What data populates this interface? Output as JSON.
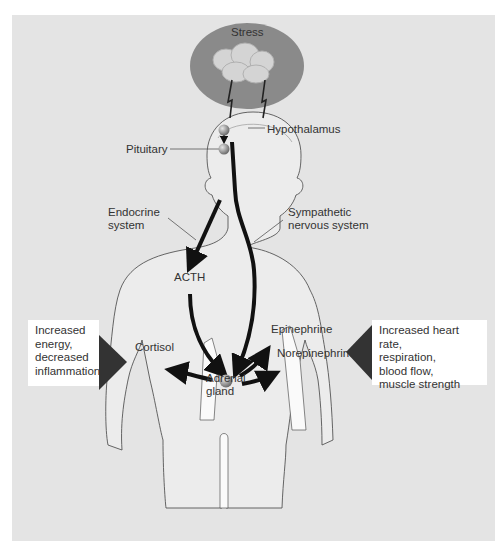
{
  "diagram": {
    "type": "stress-response-pathway",
    "colors": {
      "panel_background": "#e4e4e4",
      "stress_ellipse": "#8a8a8a",
      "brain": "#cfcfcf",
      "arrow": "#111111",
      "callout_box": "#ffffff",
      "callout_pointer": "#333333"
    },
    "stress": {
      "label": "Stress"
    },
    "labels": {
      "hypothalamus": "Hypothalamus",
      "pituitary": "Pituitary",
      "endocrine_line1": "Endocrine",
      "endocrine_line2": "system",
      "sympathetic_line1": "Sympathetic",
      "sympathetic_line2": "nervous system",
      "acth": "ACTH",
      "cortisol": "Cortisol",
      "epinephrine": "Epinephrine",
      "norepinephrine": "Norepinephrine",
      "adrenal_line1": "Adrenal",
      "adrenal_line2": "gland"
    },
    "callouts": {
      "left": [
        "Increased",
        "energy,",
        "decreased",
        "inflammation"
      ],
      "right": [
        "Increased heart rate,",
        "respiration,",
        "blood flow,",
        "muscle strength"
      ]
    },
    "pathways": [
      {
        "from": "Stress",
        "to": "Hypothalamus",
        "via": "lightning bolts"
      },
      {
        "from": "Hypothalamus",
        "to": "Pituitary"
      },
      {
        "from": "Pituitary",
        "to": "Adrenal gland",
        "via": "ACTH",
        "system": "Endocrine system"
      },
      {
        "from": "Hypothalamus",
        "to": "Adrenal gland",
        "system": "Sympathetic nervous system"
      },
      {
        "from": "Adrenal gland",
        "to": "Cortisol"
      },
      {
        "from": "Adrenal gland",
        "to": "Epinephrine"
      },
      {
        "from": "Adrenal gland",
        "to": "Norepinephrine"
      }
    ]
  }
}
